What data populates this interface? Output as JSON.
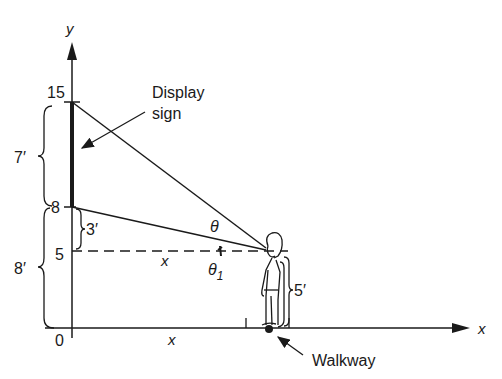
{
  "diagram": {
    "axes": {
      "y_label": "y",
      "x_label": "x",
      "origin_label": "0"
    },
    "y_ticks": [
      {
        "value": "15"
      },
      {
        "value": "8"
      },
      {
        "value": "5"
      }
    ],
    "dimensions": {
      "sign_height": "7′",
      "sign_bottom_height": "8′",
      "eye_to_sign_bottom": "3′",
      "eye_height": "5′"
    },
    "annotations": {
      "display_sign_line1": "Display",
      "display_sign_line2": "sign",
      "walkway": "Walkway",
      "theta": "θ",
      "theta1": "θ",
      "theta1_sub": "1",
      "x_dashed": "x",
      "x_axis_distance": "x"
    },
    "colors": {
      "ink": "#1a1a1a",
      "background": "#ffffff"
    }
  }
}
